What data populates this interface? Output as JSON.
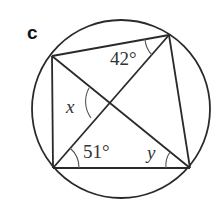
{
  "diagram": {
    "part_label": "c",
    "type": "cyclic quadrilateral with diagonals",
    "circle": {
      "cx": 121,
      "cy": 109,
      "r": 89
    },
    "vertices": {
      "top_left": {
        "x": 52,
        "y": 56
      },
      "top_right": {
        "x": 169,
        "y": 35
      },
      "bottom_right": {
        "x": 190,
        "y": 168
      },
      "bottom_left": {
        "x": 53,
        "y": 168
      }
    },
    "angles": {
      "angle_top_right": "42°",
      "angle_bottom_left": "51°",
      "angle_intersection": "x",
      "angle_bottom_right": "y"
    },
    "colors": {
      "stroke": "#2a2a2a",
      "text": "#333333",
      "background": "#ffffff"
    }
  }
}
